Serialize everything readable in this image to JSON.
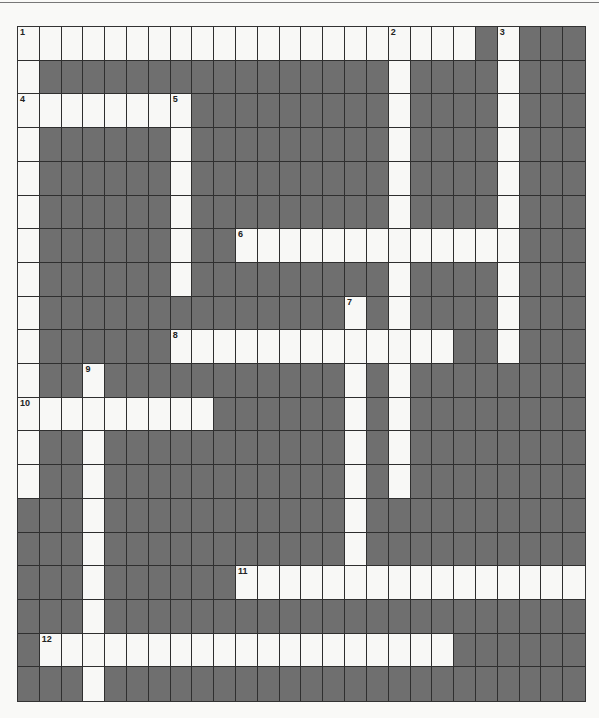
{
  "puzzle": {
    "rows": 20,
    "cols": 26,
    "colors": {
      "block": "#6f6f6f",
      "open": "#f8f8f6",
      "grid_line": "#2f2f2f"
    },
    "entries": [
      {
        "number": 1,
        "direction": "across",
        "row": 0,
        "col": 0,
        "length": 21
      },
      {
        "number": 1,
        "direction": "down",
        "row": 0,
        "col": 0,
        "length": 14
      },
      {
        "number": 2,
        "direction": "down",
        "row": 0,
        "col": 17,
        "length": 14
      },
      {
        "number": 3,
        "direction": "down",
        "row": 0,
        "col": 22,
        "length": 10
      },
      {
        "number": 4,
        "direction": "across",
        "row": 2,
        "col": 0,
        "length": 8
      },
      {
        "number": 5,
        "direction": "down",
        "row": 2,
        "col": 7,
        "length": 6
      },
      {
        "number": 6,
        "direction": "across",
        "row": 6,
        "col": 10,
        "length": 13
      },
      {
        "number": 7,
        "direction": "down",
        "row": 8,
        "col": 15,
        "length": 8
      },
      {
        "number": 8,
        "direction": "across",
        "row": 9,
        "col": 7,
        "length": 13
      },
      {
        "number": 9,
        "direction": "down",
        "row": 10,
        "col": 3,
        "length": 10
      },
      {
        "number": 10,
        "direction": "across",
        "row": 11,
        "col": 0,
        "length": 9
      },
      {
        "number": 11,
        "direction": "across",
        "row": 16,
        "col": 10,
        "length": 16
      },
      {
        "number": 12,
        "direction": "across",
        "row": 18,
        "col": 1,
        "length": 19
      }
    ],
    "numbers": [
      {
        "label": "1",
        "row": 0,
        "col": 0
      },
      {
        "label": "2",
        "row": 0,
        "col": 17
      },
      {
        "label": "3",
        "row": 0,
        "col": 22
      },
      {
        "label": "4",
        "row": 2,
        "col": 0
      },
      {
        "label": "5",
        "row": 2,
        "col": 7
      },
      {
        "label": "6",
        "row": 6,
        "col": 10
      },
      {
        "label": "7",
        "row": 8,
        "col": 15
      },
      {
        "label": "8",
        "row": 9,
        "col": 7
      },
      {
        "label": "9",
        "row": 10,
        "col": 3
      },
      {
        "label": "10",
        "row": 11,
        "col": 0
      },
      {
        "label": "11",
        "row": 16,
        "col": 10
      },
      {
        "label": "12",
        "row": 18,
        "col": 1
      }
    ]
  }
}
